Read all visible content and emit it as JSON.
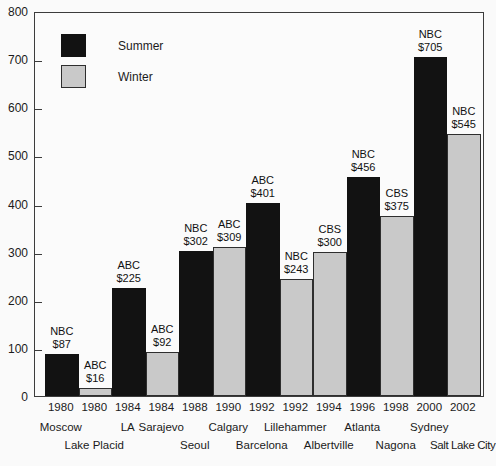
{
  "colors": {
    "summer_bar": "#121212",
    "winter_bar": "#c9c9c9",
    "axis": "#3c3c3c",
    "text": "#1b1b1b",
    "background": "#fafafa"
  },
  "legend": {
    "summer_label": "Summer",
    "winter_label": "Winter"
  },
  "chart_data": {
    "type": "bar",
    "title": "",
    "xlabel": "",
    "ylabel": "",
    "ylim": [
      0,
      800
    ],
    "y_ticks": [
      0,
      100,
      200,
      300,
      400,
      500,
      600,
      700,
      800
    ],
    "grid": false,
    "legend_position": "top-left-inside",
    "legend_entries": [
      "Summer",
      "Winter"
    ],
    "bars": [
      {
        "year": "1980",
        "city": "Moscow",
        "season": "Summer",
        "network": "NBC",
        "value": 87,
        "value_label": "$87",
        "city_row": 1
      },
      {
        "year": "1980",
        "city": "Lake Placid",
        "season": "Winter",
        "network": "ABC",
        "value": 16,
        "value_label": "$16",
        "city_row": 2
      },
      {
        "year": "1984",
        "city": "LA",
        "season": "Summer",
        "network": "ABC",
        "value": 225,
        "value_label": "$225",
        "city_row": 1
      },
      {
        "year": "1984",
        "city": "Sarajevo",
        "season": "Winter",
        "network": "ABC",
        "value": 92,
        "value_label": "$92",
        "city_row": 1
      },
      {
        "year": "1988",
        "city": "Seoul",
        "season": "Summer",
        "network": "NBC",
        "value": 302,
        "value_label": "$302",
        "city_row": 2
      },
      {
        "year": "1990",
        "city": "Calgary",
        "season": "Winter",
        "network": "ABC",
        "value": 309,
        "value_label": "$309",
        "city_row": 1
      },
      {
        "year": "1992",
        "city": "Barcelona",
        "season": "Summer",
        "network": "ABC",
        "value": 401,
        "value_label": "$401",
        "city_row": 2
      },
      {
        "year": "1992",
        "city": "Lillehammer",
        "season": "Winter",
        "network": "NBC",
        "value": 243,
        "value_label": "$243",
        "city_row": 1
      },
      {
        "year": "1994",
        "city": "Albertville",
        "season": "Winter",
        "network": "CBS",
        "value": 300,
        "value_label": "$300",
        "city_row": 2
      },
      {
        "year": "1996",
        "city": "Atlanta",
        "season": "Summer",
        "network": "NBC",
        "value": 456,
        "value_label": "$456",
        "city_row": 1
      },
      {
        "year": "1998",
        "city": "Nagona",
        "season": "Winter",
        "network": "CBS",
        "value": 375,
        "value_label": "$375",
        "city_row": 2
      },
      {
        "year": "2000",
        "city": "Sydney",
        "season": "Summer",
        "network": "NBC",
        "value": 705,
        "value_label": "$705",
        "city_row": 1
      },
      {
        "year": "2002",
        "city": "Salt Lake City",
        "season": "Winter",
        "network": "NBC",
        "value": 545,
        "value_label": "$545",
        "city_row": 2
      }
    ]
  },
  "geometry": {
    "plot_left": 34,
    "plot_top": 12,
    "plot_width": 450,
    "plot_height": 385,
    "first_bar_offset": 10,
    "bar_slot_width": 33.5,
    "y_max": 800
  }
}
